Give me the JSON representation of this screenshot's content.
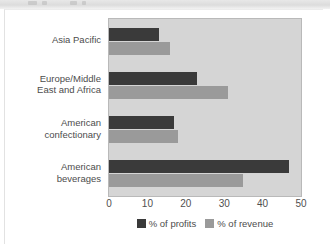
{
  "chart_data": {
    "type": "bar",
    "orientation": "horizontal",
    "title": "",
    "xlabel": "",
    "ylabel": "",
    "xlim": [
      0,
      50
    ],
    "xticks": [
      0,
      10,
      20,
      30,
      40,
      50
    ],
    "grid": false,
    "legend_position": "bottom",
    "categories": [
      "Asia Pacific",
      "Europe/Middle East and Africa",
      "American confectionary",
      "American beverages"
    ],
    "category_lines": [
      [
        "Asia Pacific"
      ],
      [
        "Europe/Middle",
        "East and Africa"
      ],
      [
        "American",
        "confectionary"
      ],
      [
        "American",
        "beverages"
      ]
    ],
    "series": [
      {
        "name": "% of profits",
        "color": "#3a3a3a",
        "values": [
          13,
          23,
          17,
          47
        ]
      },
      {
        "name": "% of revenue",
        "color": "#9a9a9a",
        "values": [
          16,
          31,
          18,
          35
        ]
      }
    ]
  },
  "colors": {
    "plot_background": "#d5d5d5",
    "plot_border": "#b9b9b9",
    "page_background": "#ffffff",
    "text": "#4c4c4c",
    "profits": "#3a3a3a",
    "revenue": "#9a9a9a"
  }
}
